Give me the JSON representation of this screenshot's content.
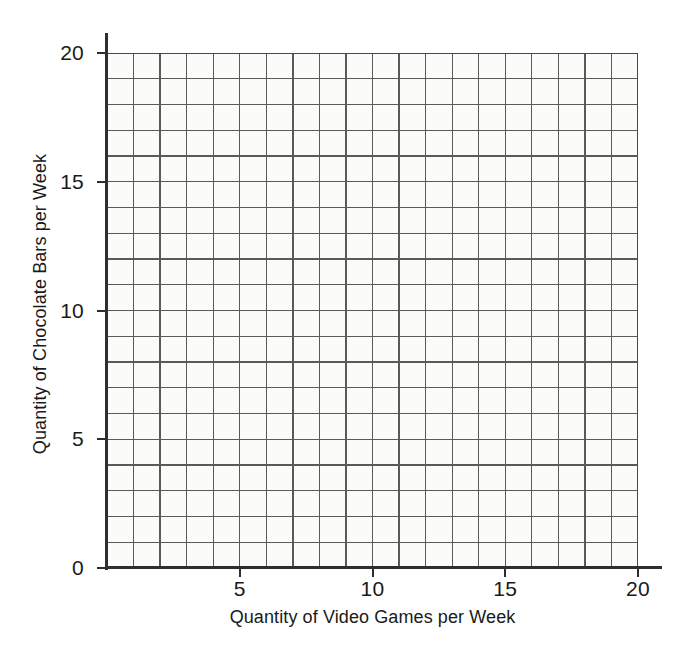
{
  "chart_data": {
    "type": "scatter",
    "title": "",
    "subtitle": "",
    "xlabel": "Quantity of Video Games per Week",
    "ylabel": "Quantity of Chocolate Bars per Week",
    "xlim": [
      0,
      20
    ],
    "ylim": [
      0,
      20
    ],
    "x_major_ticks": [
      5,
      10,
      15,
      20
    ],
    "y_major_ticks": [
      0,
      5,
      10,
      15,
      20
    ],
    "x_tick_labels": [
      "5",
      "10",
      "15",
      "20"
    ],
    "y_tick_labels": [
      "0",
      "5",
      "10",
      "15",
      "20"
    ],
    "x_minor_step": 1,
    "y_minor_step": 1,
    "grid": true,
    "grid_columns": 20,
    "grid_rows": 20,
    "legend": null,
    "legend_position": "none",
    "series": [],
    "x": [],
    "values": [],
    "annotations": [],
    "note": "Empty blank grid for plotting; no data points are drawn."
  },
  "axes": {
    "x_title": "Quantity of Video Games per Week",
    "y_title": "Quantity of Chocolate Bars per Week",
    "x_ticks": [
      {
        "value": 5,
        "label": "5"
      },
      {
        "value": 10,
        "label": "10"
      },
      {
        "value": 15,
        "label": "15"
      },
      {
        "value": 20,
        "label": "20"
      }
    ],
    "y_ticks": [
      {
        "value": 20,
        "label": "20"
      },
      {
        "value": 15,
        "label": "15"
      },
      {
        "value": 10,
        "label": "10"
      },
      {
        "value": 5,
        "label": "5"
      },
      {
        "value": 0,
        "label": "0"
      }
    ]
  },
  "colors": {
    "page_background": "#ffffff",
    "plot_background": "#fbfbfa",
    "grid_line": "#5a5a5a",
    "axis_line": "#2e2e2e",
    "text": "#1a1a1a"
  }
}
